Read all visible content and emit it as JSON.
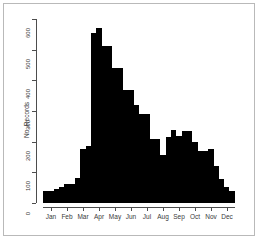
{
  "chart_data": {
    "type": "bar",
    "title": "",
    "subtitle": "",
    "xlabel": "",
    "ylabel": "No. Records",
    "ylim": [
      0,
      600
    ],
    "grid": false,
    "legend": null,
    "annotations": [],
    "y_ticks": [
      0,
      100,
      200,
      300,
      400,
      500,
      600
    ],
    "y_tick_labels": [
      "0",
      "100",
      "200",
      "300",
      "400",
      "500",
      "600"
    ],
    "x_tick_labels": [
      "Jan",
      "Feb",
      "Mar",
      "Apr",
      "May",
      "Jun",
      "Jul",
      "Aug",
      "Sep",
      "Oct",
      "Nov",
      "Dec"
    ],
    "x_note": "12 month tick labels; histogram binned into 36 bins (3 bins per month)",
    "categories": [
      "Jan-1",
      "Jan-2",
      "Jan-3",
      "Feb-1",
      "Feb-2",
      "Feb-3",
      "Mar-1",
      "Mar-2",
      "Mar-3",
      "Apr-1",
      "Apr-2",
      "Apr-3",
      "May-1",
      "May-2",
      "May-3",
      "Jun-1",
      "Jun-2",
      "Jun-3",
      "Jul-1",
      "Jul-2",
      "Jul-3",
      "Aug-1",
      "Aug-2",
      "Aug-3",
      "Sep-1",
      "Sep-2",
      "Sep-3",
      "Oct-1",
      "Oct-2",
      "Oct-3",
      "Nov-1",
      "Nov-2",
      "Nov-3",
      "Dec-1",
      "Dec-2",
      "Dec-3"
    ],
    "values": [
      38,
      38,
      45,
      52,
      62,
      62,
      80,
      175,
      185,
      555,
      570,
      512,
      512,
      440,
      440,
      370,
      370,
      318,
      290,
      290,
      210,
      210,
      155,
      215,
      237,
      220,
      235,
      235,
      200,
      170,
      170,
      175,
      120,
      78,
      52,
      38
    ],
    "bar_color": "#000000",
    "axis_color": "#4d4d4d",
    "background_color": "#ffffff",
    "frame_color": "#b9b9b9"
  }
}
